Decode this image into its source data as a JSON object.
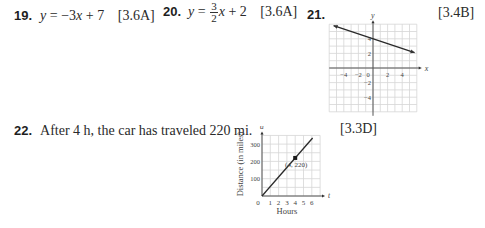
{
  "problems": [
    {
      "number": "19.",
      "answer_lhs": "y",
      "answer_rhs": "= −3",
      "answer_var": "x",
      "answer_tail": " + 7",
      "reference": "[3.6A]"
    },
    {
      "number": "20.",
      "answer_lhs": "y",
      "answer_eq": "=",
      "frac_num": "3",
      "frac_den": "2",
      "answer_var": "x",
      "answer_tail": " + 2",
      "reference": "[3.6A]"
    },
    {
      "number": "21.",
      "reference": "[3.4B]"
    },
    {
      "number": "22.",
      "answer_text": "After 4 h, the car has traveled 220 mi.",
      "reference": "[3.3D]"
    }
  ],
  "chart_data": [
    {
      "type": "line",
      "title": "",
      "xlabel": "x",
      "ylabel": "y",
      "xlim": [
        -6,
        6
      ],
      "ylim": [
        -6,
        6
      ],
      "grid": true,
      "x_ticks": [
        -4,
        -2,
        0,
        2,
        4
      ],
      "x_tick_labels": [
        "−4",
        "−2",
        "0",
        "2",
        "4"
      ],
      "y_ticks": [
        4,
        2,
        -2,
        -4
      ],
      "y_tick_labels": [
        "4",
        "2",
        "−2",
        "−4"
      ],
      "series": [
        {
          "name": "line",
          "x": [
            -5.4,
            5.7
          ],
          "y": [
            5.8,
            2.1
          ],
          "arrows": "both"
        }
      ]
    },
    {
      "type": "line",
      "title": "",
      "xlabel": "Hours",
      "ylabel": "Distance (in miles)",
      "x_axis_var": "t",
      "y_axis_var": "d",
      "xlim": [
        0,
        7
      ],
      "ylim": [
        0,
        350
      ],
      "grid": true,
      "x_ticks": [
        0,
        1,
        2,
        3,
        4,
        5,
        6
      ],
      "x_tick_labels": [
        "0",
        "1",
        "2",
        "3",
        "4",
        "5",
        "6"
      ],
      "y_ticks": [
        100,
        200,
        300
      ],
      "y_tick_labels": [
        "100",
        "200",
        "300"
      ],
      "series": [
        {
          "name": "distance",
          "x": [
            0,
            6.1
          ],
          "y": [
            0,
            335
          ]
        }
      ],
      "points": [
        {
          "x": 4,
          "y": 220,
          "label": "(4, 220)"
        }
      ]
    }
  ]
}
